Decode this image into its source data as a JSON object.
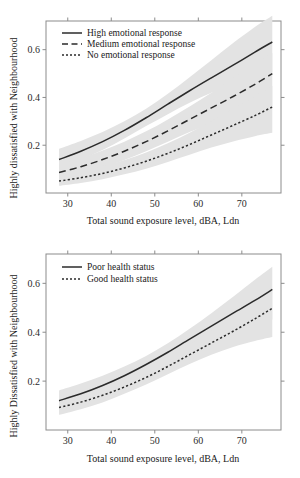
{
  "figure": {
    "panel_count": 2,
    "background": "#ffffff",
    "band_color": "#e3e3e3",
    "line_color": "#2b2b2b",
    "axis_color": "#8c8c8c"
  },
  "chart_data": [
    {
      "type": "line",
      "title": "",
      "xlabel": "Total sound exposure level, dBA, Ldn",
      "ylabel": "Highly dissatisfied with Neighbourhood",
      "xlim": [
        25,
        79
      ],
      "ylim": [
        0.0,
        0.72
      ],
      "xticks": [
        30,
        40,
        50,
        60,
        70
      ],
      "yticks": [
        0.2,
        0.4,
        0.6
      ],
      "xticklabels": [
        "30",
        "40",
        "50",
        "60",
        "70"
      ],
      "yticklabels": [
        "0.2",
        "0.4",
        "0.6"
      ],
      "grid": false,
      "legend_position": "top-left",
      "x": [
        28,
        33,
        38,
        43,
        48,
        53,
        58,
        63,
        68,
        73,
        77
      ],
      "series": [
        {
          "name": "High emotional response",
          "style": "solid",
          "values": [
            0.14,
            0.175,
            0.215,
            0.262,
            0.315,
            0.372,
            0.428,
            0.482,
            0.535,
            0.59,
            0.632
          ],
          "band_lower": [
            0.1,
            0.14,
            0.18,
            0.228,
            0.28,
            0.33,
            0.378,
            0.42,
            0.455,
            0.485,
            0.505
          ],
          "band_upper": [
            0.185,
            0.218,
            0.255,
            0.3,
            0.353,
            0.415,
            0.485,
            0.556,
            0.628,
            0.695,
            0.742
          ]
        },
        {
          "name": "Medium emotional response",
          "style": "dashed",
          "values": [
            0.086,
            0.11,
            0.14,
            0.175,
            0.215,
            0.26,
            0.308,
            0.356,
            0.404,
            0.455,
            0.5
          ],
          "band_lower": [
            0.055,
            0.078,
            0.105,
            0.138,
            0.175,
            0.215,
            0.255,
            0.29,
            0.32,
            0.345,
            0.362
          ],
          "band_upper": [
            0.12,
            0.145,
            0.178,
            0.215,
            0.258,
            0.308,
            0.362,
            0.42,
            0.48,
            0.54,
            0.585
          ]
        },
        {
          "name": "No emotional response",
          "style": "dotted",
          "values": [
            0.05,
            0.064,
            0.082,
            0.105,
            0.133,
            0.166,
            0.203,
            0.243,
            0.283,
            0.324,
            0.36
          ],
          "band_lower": [
            0.03,
            0.042,
            0.058,
            0.078,
            0.102,
            0.13,
            0.16,
            0.19,
            0.216,
            0.238,
            0.252
          ],
          "band_upper": [
            0.075,
            0.092,
            0.112,
            0.138,
            0.17,
            0.208,
            0.252,
            0.3,
            0.352,
            0.405,
            0.448
          ]
        }
      ]
    },
    {
      "type": "line",
      "title": "",
      "xlabel": "Total sound exposure level, dBA, Ldn",
      "ylabel": "Highly Dissatisfied with Neighbourhood",
      "xlim": [
        25,
        79
      ],
      "ylim": [
        0.0,
        0.72
      ],
      "xticks": [
        30,
        40,
        50,
        60,
        70
      ],
      "yticks": [
        0.2,
        0.4,
        0.6
      ],
      "xticklabels": [
        "30",
        "40",
        "50",
        "60",
        "70"
      ],
      "yticklabels": [
        "0.2",
        "0.4",
        "0.6"
      ],
      "grid": false,
      "legend_position": "top-left",
      "x": [
        28,
        33,
        38,
        43,
        48,
        53,
        58,
        63,
        68,
        73,
        77
      ],
      "series": [
        {
          "name": "Poor health status",
          "style": "solid",
          "values": [
            0.12,
            0.148,
            0.182,
            0.222,
            0.268,
            0.318,
            0.372,
            0.425,
            0.478,
            0.53,
            0.575
          ],
          "band_lower": [
            0.082,
            0.11,
            0.145,
            0.188,
            0.234,
            0.283,
            0.33,
            0.372,
            0.406,
            0.434,
            0.452
          ],
          "band_upper": [
            0.162,
            0.19,
            0.222,
            0.26,
            0.303,
            0.355,
            0.414,
            0.478,
            0.545,
            0.615,
            0.668
          ]
        },
        {
          "name": "Good health status",
          "style": "dotted",
          "values": [
            0.092,
            0.114,
            0.142,
            0.176,
            0.215,
            0.26,
            0.308,
            0.356,
            0.404,
            0.455,
            0.498
          ],
          "band_lower": [
            0.062,
            0.085,
            0.113,
            0.148,
            0.186,
            0.228,
            0.27,
            0.308,
            0.34,
            0.364,
            0.38
          ],
          "band_upper": [
            0.124,
            0.148,
            0.176,
            0.21,
            0.25,
            0.296,
            0.35,
            0.408,
            0.468,
            0.53,
            0.578
          ]
        }
      ]
    }
  ]
}
